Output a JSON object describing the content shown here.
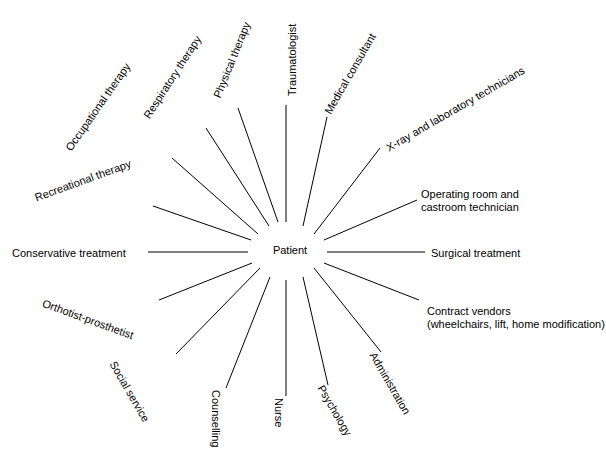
{
  "diagram": {
    "type": "radial-spoke",
    "center": {
      "label": "Patient",
      "x": 290,
      "y": 250
    },
    "line_color": "#000000",
    "background_color": "#ffffff",
    "text_color": "#000000",
    "nodes": [
      {
        "id": "traumatologist",
        "label": "Traumatologist",
        "rotation": -90,
        "anchor": "left",
        "text_x": 286,
        "text_y": 96,
        "line": {
          "x1": 286,
          "y1": 105,
          "x2": 286,
          "y2": 222
        }
      },
      {
        "id": "medical-consultant",
        "label": "Medical consultant",
        "rotation": -60,
        "anchor": "left",
        "text_x": 322,
        "text_y": 110,
        "line": {
          "x1": 327,
          "y1": 117,
          "x2": 303,
          "y2": 226
        }
      },
      {
        "id": "xray-and-laboratory-technicians",
        "label": "X-ray and laboratory technicians",
        "rotation": -30,
        "anchor": "left",
        "text_x": 384,
        "text_y": 143,
        "line": {
          "x1": 380,
          "y1": 148,
          "x2": 314,
          "y2": 234
        }
      },
      {
        "id": "operating-room-and-castroom-technician",
        "label": "Operating room and\ncastroom technician",
        "rotation": 0,
        "anchor": "left",
        "text_x": 421,
        "text_y": 188,
        "line": {
          "x1": 417,
          "y1": 200,
          "x2": 324,
          "y2": 240
        }
      },
      {
        "id": "surgical-treatment",
        "label": "Surgical treatment",
        "rotation": 0,
        "anchor": "left",
        "text_x": 431,
        "text_y": 247,
        "line": {
          "x1": 425,
          "y1": 252,
          "x2": 327,
          "y2": 252
        }
      },
      {
        "id": "contract-vendors",
        "label": "Contract vendors\n(wheelchairs, lift, home modification)",
        "rotation": 0,
        "anchor": "left",
        "text_x": 427,
        "text_y": 305,
        "line": {
          "x1": 419,
          "y1": 300,
          "x2": 324,
          "y2": 263
        }
      },
      {
        "id": "administration",
        "label": "Administration",
        "rotation": 60,
        "anchor": "left",
        "text_x": 378,
        "text_y": 350,
        "line": {
          "x1": 381,
          "y1": 352,
          "x2": 314,
          "y2": 268
        }
      },
      {
        "id": "psychology",
        "label": "Psychology",
        "rotation": 60,
        "anchor": "left",
        "text_x": 326,
        "text_y": 383,
        "line": {
          "x1": 328,
          "y1": 385,
          "x2": 303,
          "y2": 277
        }
      },
      {
        "id": "nurse",
        "label": "Nurse",
        "rotation": 90,
        "anchor": "left",
        "text_x": 285,
        "text_y": 398,
        "line": {
          "x1": 286,
          "y1": 396,
          "x2": 286,
          "y2": 280
        }
      },
      {
        "id": "counselling",
        "label": "Counselling",
        "rotation": 90,
        "anchor": "left",
        "text_x": 222,
        "text_y": 390,
        "line": {
          "x1": 226,
          "y1": 388,
          "x2": 270,
          "y2": 277
        }
      },
      {
        "id": "social-service",
        "label": "Social service",
        "rotation": 60,
        "anchor": "left",
        "text_x": 118,
        "text_y": 359,
        "line": {
          "x1": 176,
          "y1": 354,
          "x2": 260,
          "y2": 268
        }
      },
      {
        "id": "orthotist-prosthetist",
        "label": "Orthotist-prosthetist",
        "rotation": 20,
        "anchor": "left",
        "text_x": 45,
        "text_y": 297,
        "line": {
          "x1": 159,
          "y1": 300,
          "x2": 252,
          "y2": 263
        }
      },
      {
        "id": "conservative-treatment",
        "label": "Conservative treatment",
        "rotation": 0,
        "anchor": "left",
        "text_x": 12,
        "text_y": 247,
        "line": {
          "x1": 148,
          "y1": 252,
          "x2": 248,
          "y2": 252
        }
      },
      {
        "id": "recreational-therapy",
        "label": "Recreational therapy",
        "rotation": -20,
        "anchor": "left",
        "text_x": 33,
        "text_y": 192,
        "line": {
          "x1": 153,
          "y1": 206,
          "x2": 251,
          "y2": 240
        }
      },
      {
        "id": "occupational-therapy",
        "label": "Occupational therapy",
        "rotation": -55,
        "anchor": "left",
        "text_x": 63,
        "text_y": 146,
        "line": {
          "x1": 172,
          "y1": 158,
          "x2": 258,
          "y2": 234
        }
      },
      {
        "id": "respiratory-therapy",
        "label": "Respiratory therapy",
        "rotation": -57,
        "anchor": "left",
        "text_x": 141,
        "text_y": 114,
        "line": {
          "x1": 206,
          "y1": 128,
          "x2": 269,
          "y2": 226
        }
      },
      {
        "id": "physical-therapy",
        "label": "Physical therapy",
        "rotation": -68,
        "anchor": "left",
        "text_x": 211,
        "text_y": 95,
        "line": {
          "x1": 238,
          "y1": 108,
          "x2": 278,
          "y2": 222
        }
      }
    ]
  }
}
